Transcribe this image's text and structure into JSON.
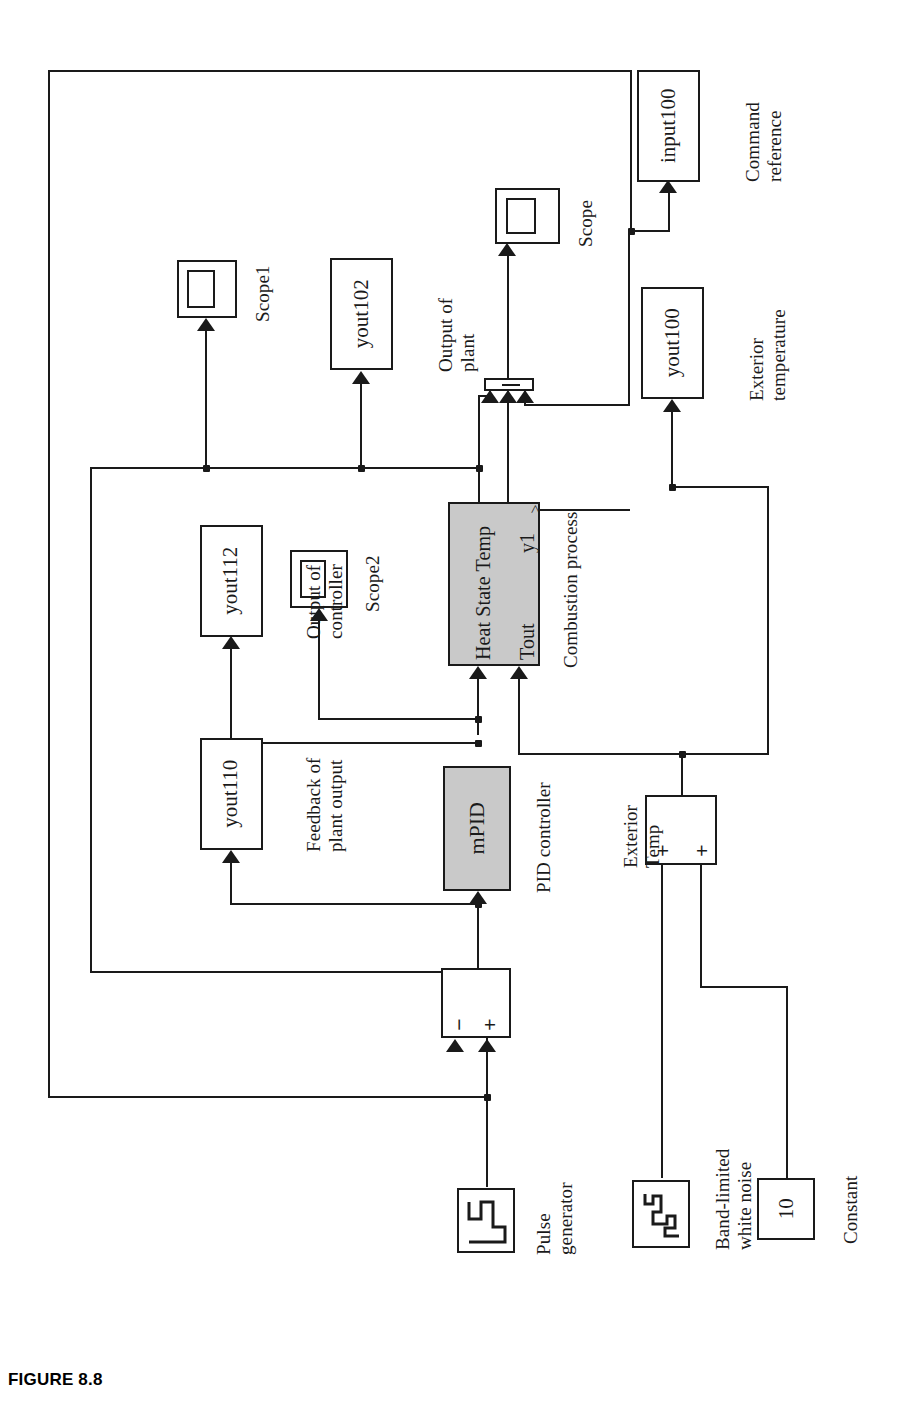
{
  "figure": {
    "caption": "FIGURE 8.8",
    "orientation": "rotated-90-ccw",
    "background": "#ffffff",
    "line_color": "#1a1a1a",
    "highlight_block_fill": "#c9c9c9"
  },
  "blocks": {
    "input100": {
      "label": "input100",
      "annotation": "Command\nreference",
      "ann_line1": "Command",
      "ann_line2": "reference",
      "type": "to-workspace"
    },
    "yout100": {
      "label": "yout100",
      "ann_line1": "Exterior",
      "ann_line2": "temperature",
      "type": "to-workspace"
    },
    "yout102": {
      "label": "yout102",
      "ann_line1": "Output of",
      "ann_line2": "plant",
      "type": "to-workspace"
    },
    "yout110": {
      "label": "yout110",
      "ann_line1": "Feedback of",
      "ann_line2": "plant output",
      "type": "to-workspace"
    },
    "yout112": {
      "label": "yout112",
      "ann_line1": "Output of",
      "ann_line2": "controller",
      "type": "to-workspace"
    },
    "scope": {
      "label": "Scope",
      "type": "scope"
    },
    "scope1": {
      "label": "Scope1",
      "type": "scope"
    },
    "scope2": {
      "label": "Scope2",
      "type": "scope"
    },
    "plant": {
      "label": "Combustion process",
      "in1": "Heat State Temp",
      "in2": "Tout",
      "out1": "y1",
      "fill": "#c9c9c9",
      "type": "subsystem"
    },
    "controller": {
      "label": "mPID",
      "annotation": "PID controller",
      "fill": "#c9c9c9",
      "type": "subsystem"
    },
    "error_sum": {
      "sign1": "−",
      "sign2": "+",
      "type": "sum"
    },
    "ext_sum": {
      "ann_line1": "Exterior",
      "ann_line2": "Temp",
      "sign1": "+",
      "sign2": "+",
      "type": "sum"
    },
    "pulse": {
      "ann_line1": "Pulse",
      "ann_line2": "generator",
      "type": "pulse-generator"
    },
    "noise": {
      "ann_line1": "Band-limited",
      "ann_line2": "white noise",
      "type": "band-limited-white-noise"
    },
    "constant": {
      "label": "10",
      "annotation": "Constant",
      "type": "constant"
    }
  }
}
